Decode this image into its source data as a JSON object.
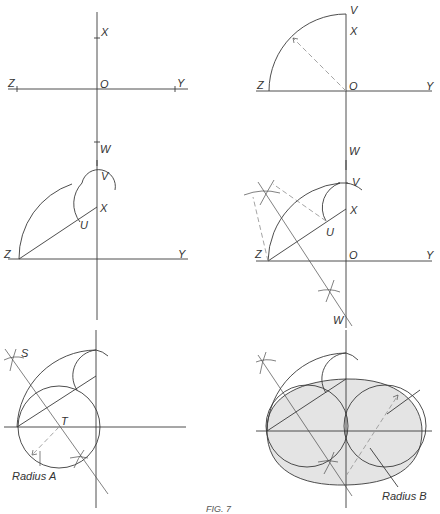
{
  "figure": {
    "caption": "FIG. 7",
    "panels": [
      {
        "id": "panel-1",
        "labels": {
          "x": "X",
          "o": "O",
          "z": "Z",
          "y": "Y",
          "w": "W"
        }
      },
      {
        "id": "panel-2",
        "labels": {
          "v": "V",
          "x": "X",
          "z": "Z",
          "o": "O",
          "y": "Y",
          "w": "W"
        }
      },
      {
        "id": "panel-3",
        "labels": {
          "v": "V",
          "x": "X",
          "u": "U",
          "z": "Z",
          "y": "Y"
        }
      },
      {
        "id": "panel-4",
        "labels": {
          "v": "V",
          "x": "X",
          "u": "U",
          "z": "Z",
          "o": "O",
          "y": "Y",
          "w": "W"
        }
      },
      {
        "id": "panel-5",
        "labels": {
          "s": "S",
          "t": "T",
          "radius": "Radius A"
        }
      },
      {
        "id": "panel-6",
        "labels": {
          "radius": "Radius B"
        }
      }
    ]
  }
}
